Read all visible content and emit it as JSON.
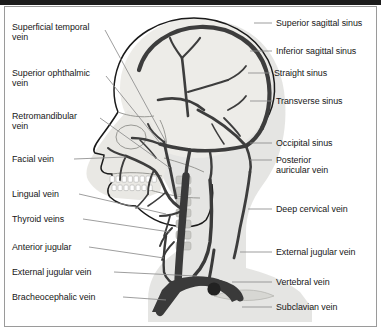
{
  "figure": {
    "view": "lateral",
    "colors": {
      "vessel": "#3d3d3d",
      "vessel_dark": "#2a2a2a",
      "outline": "#1a1a1a",
      "bone_fill": "#e9e9e6",
      "skull_fill": "#eeeeea",
      "soft_tissue": "#dedede",
      "leader": "#8d8d8d",
      "frame": "#9a9a9a",
      "text": "#171717",
      "top_rule": "#1c1c1c",
      "page": "#ffffff"
    }
  },
  "labels_left": [
    {
      "id": "superficial-temporal-vein",
      "line1": "Superficial temporal",
      "line2": "vein"
    },
    {
      "id": "superior-ophthalmic-vein",
      "line1": "Superior ophthalmic",
      "line2": "vein"
    },
    {
      "id": "retromandibular-vein",
      "line1": "Retromandibular",
      "line2": "vein"
    },
    {
      "id": "facial-vein",
      "line1": "Facial vein",
      "line2": ""
    },
    {
      "id": "lingual-vein",
      "line1": "Lingual vein",
      "line2": ""
    },
    {
      "id": "thyroid-veins",
      "line1": "Thyroid veins",
      "line2": ""
    },
    {
      "id": "anterior-jugular",
      "line1": "Anterior jugular",
      "line2": ""
    },
    {
      "id": "external-jugular-vein-left",
      "line1": "External jugular vein",
      "line2": ""
    },
    {
      "id": "bracheocephalic-vein",
      "line1": "Bracheocephalic vein",
      "line2": ""
    }
  ],
  "labels_right": [
    {
      "id": "superior-sagittal-sinus",
      "line1": "Superior sagittal sinus",
      "line2": ""
    },
    {
      "id": "inferior-sagittal-sinus",
      "line1": "Inferior sagittal sinus",
      "line2": ""
    },
    {
      "id": "straight-sinus",
      "line1": "Straight sinus",
      "line2": ""
    },
    {
      "id": "transverse-sinus",
      "line1": "Transverse sinus",
      "line2": ""
    },
    {
      "id": "occipital-sinus",
      "line1": "Occipital sinus",
      "line2": ""
    },
    {
      "id": "posterior-auricular-vein",
      "line1": "Posterior",
      "line2": "auricular vein"
    },
    {
      "id": "deep-cervical-vein",
      "line1": "Deep cervical vein",
      "line2": ""
    },
    {
      "id": "external-jugular-vein-right",
      "line1": "External jugular vein",
      "line2": ""
    },
    {
      "id": "vertebral-vein",
      "line1": "Vertebral vein",
      "line2": ""
    },
    {
      "id": "subclavian-vein",
      "line1": "Subclavian vein",
      "line2": ""
    }
  ]
}
